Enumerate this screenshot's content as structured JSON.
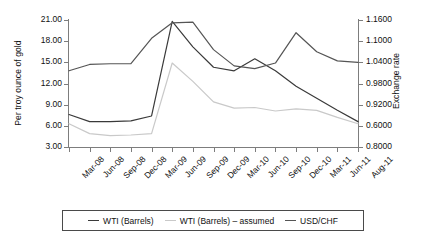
{
  "chart_data": {
    "type": "line",
    "title": "",
    "xlabel": "",
    "ylabel": "Per troy ounce of gold",
    "y2label": "Exchange rate",
    "grid": false,
    "legend_position": "bottom",
    "categories": [
      "Mar-08",
      "Jun-08",
      "Sep-08",
      "Dec-08",
      "Mar-09",
      "Jun-09",
      "Sep-09",
      "Dec-09",
      "Mar-10",
      "Jun-10",
      "Sep-10",
      "Dec-10",
      "Mar-11",
      "Jun-11",
      "Aug-11"
    ],
    "ylim": [
      3.0,
      21.0
    ],
    "yticks": [
      "21.00",
      "18.00",
      "15.00",
      "12.00",
      "9.00",
      "6.00",
      "3.00"
    ],
    "y2ticks": [
      "1.1600",
      "1.1000",
      "1.0400",
      "0.9800",
      "0.9200",
      "0.6000",
      "0.8000"
    ],
    "series": [
      {
        "name": "WTI (Barrels)",
        "color": "#3a3a3a",
        "axis": "left",
        "values": [
          7.6,
          6.6,
          6.6,
          6.7,
          7.4,
          20.8,
          17.2,
          14.3,
          13.8,
          15.5,
          13.8,
          11.6,
          9.9,
          8.2,
          6.6
        ]
      },
      {
        "name": "WTI (Barrels) – assumed",
        "color": "#c9c9c9",
        "axis": "left",
        "values": [
          6.3,
          4.9,
          4.6,
          4.7,
          4.9,
          14.9,
          12.3,
          9.4,
          8.5,
          8.6,
          8.1,
          8.4,
          8.2,
          7.2,
          6.3
        ]
      },
      {
        "name": "USD/CHF",
        "color": "#555555",
        "axis": "right",
        "values": [
          13.8,
          14.7,
          14.8,
          14.8,
          18.4,
          20.6,
          20.7,
          16.8,
          14.5,
          14.1,
          14.9,
          19.2,
          16.5,
          15.2,
          15.0
        ]
      }
    ]
  },
  "legend": {
    "items": [
      {
        "label": "WTI (Barrels)",
        "color": "#3a3a3a"
      },
      {
        "label": "WTI (Barrels) – assumed",
        "color": "#c9c9c9"
      },
      {
        "label": "USD/CHF",
        "color": "#555555"
      }
    ]
  }
}
